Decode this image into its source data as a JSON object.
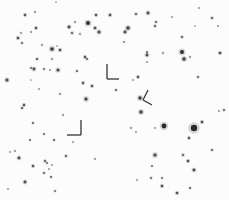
{
  "image": {
    "width": 229,
    "height": 200,
    "background": "#fcfcfc",
    "star_color": "#2a2a2a",
    "marker_color": "#333333"
  },
  "stars": [
    {
      "x": 25,
      "y": 15,
      "r": 1.2
    },
    {
      "x": 35,
      "y": 12,
      "r": 0.8
    },
    {
      "x": 56,
      "y": 2,
      "r": 0.6
    },
    {
      "x": 69,
      "y": 27,
      "r": 1.4
    },
    {
      "x": 72,
      "y": 33,
      "r": 1.1
    },
    {
      "x": 75,
      "y": 22,
      "r": 0.8
    },
    {
      "x": 88,
      "y": 23,
      "r": 2.0
    },
    {
      "x": 95,
      "y": 28,
      "r": 1.3
    },
    {
      "x": 96,
      "y": 15,
      "r": 1.2
    },
    {
      "x": 99,
      "y": 32,
      "r": 1.5
    },
    {
      "x": 80,
      "y": 34,
      "r": 0.8
    },
    {
      "x": 110,
      "y": 15,
      "r": 1.3
    },
    {
      "x": 36,
      "y": 28,
      "r": 1.2
    },
    {
      "x": 31,
      "y": 32,
      "r": 0.8
    },
    {
      "x": 21,
      "y": 33,
      "r": 0.8
    },
    {
      "x": 18,
      "y": 38,
      "r": 1.3
    },
    {
      "x": 22,
      "y": 43,
      "r": 1.0
    },
    {
      "x": 42,
      "y": 45,
      "r": 0.8
    },
    {
      "x": 52,
      "y": 49,
      "r": 1.8
    },
    {
      "x": 60,
      "y": 50,
      "r": 1.3
    },
    {
      "x": 57,
      "y": 46,
      "r": 0.6
    },
    {
      "x": 37,
      "y": 59,
      "r": 1.1
    },
    {
      "x": 52,
      "y": 59,
      "r": 0.8
    },
    {
      "x": 85,
      "y": 57,
      "r": 1.2
    },
    {
      "x": 87,
      "y": 59,
      "r": 1.0
    },
    {
      "x": 31,
      "y": 68,
      "r": 0.9
    },
    {
      "x": 34,
      "y": 69,
      "r": 1.4
    },
    {
      "x": 44,
      "y": 69,
      "r": 0.9
    },
    {
      "x": 50,
      "y": 70,
      "r": 0.7
    },
    {
      "x": 58,
      "y": 70,
      "r": 1.5
    },
    {
      "x": 77,
      "y": 71,
      "r": 1.0
    },
    {
      "x": 7,
      "y": 80,
      "r": 1.5
    },
    {
      "x": 31,
      "y": 80,
      "r": 0.6
    },
    {
      "x": 39,
      "y": 89,
      "r": 0.7
    },
    {
      "x": 60,
      "y": 94,
      "r": 0.8
    },
    {
      "x": 83,
      "y": 83,
      "r": 1.2
    },
    {
      "x": 92,
      "y": 86,
      "r": 1.2
    },
    {
      "x": 86,
      "y": 99,
      "r": 1.6
    },
    {
      "x": 136,
      "y": 14,
      "r": 1.1
    },
    {
      "x": 148,
      "y": 13,
      "r": 1.4
    },
    {
      "x": 156,
      "y": 22,
      "r": 1.0
    },
    {
      "x": 155,
      "y": 26,
      "r": 1.1
    },
    {
      "x": 128,
      "y": 28,
      "r": 1.7
    },
    {
      "x": 125,
      "y": 32,
      "r": 1.4
    },
    {
      "x": 124,
      "y": 42,
      "r": 0.8
    },
    {
      "x": 172,
      "y": 17,
      "r": 0.7
    },
    {
      "x": 199,
      "y": 8,
      "r": 0.7
    },
    {
      "x": 212,
      "y": 18,
      "r": 1.1
    },
    {
      "x": 218,
      "y": 26,
      "r": 0.7
    },
    {
      "x": 195,
      "y": 26,
      "r": 0.6
    },
    {
      "x": 182,
      "y": 37,
      "r": 1.1
    },
    {
      "x": 147,
      "y": 52,
      "r": 0.9
    },
    {
      "x": 147,
      "y": 55,
      "r": 1.4
    },
    {
      "x": 163,
      "y": 53,
      "r": 0.8
    },
    {
      "x": 182,
      "y": 52,
      "r": 2.0
    },
    {
      "x": 184,
      "y": 59,
      "r": 1.7
    },
    {
      "x": 190,
      "y": 57,
      "r": 0.8
    },
    {
      "x": 220,
      "y": 53,
      "r": 1.3
    },
    {
      "x": 147,
      "y": 62,
      "r": 0.7
    },
    {
      "x": 138,
      "y": 77,
      "r": 1.2
    },
    {
      "x": 133,
      "y": 80,
      "r": 0.7
    },
    {
      "x": 198,
      "y": 77,
      "r": 1.0
    },
    {
      "x": 116,
      "y": 90,
      "r": 1.0
    },
    {
      "x": 140,
      "y": 98,
      "r": 1.7
    },
    {
      "x": 141,
      "y": 112,
      "r": 1.7
    },
    {
      "x": 164,
      "y": 126,
      "r": 2.4
    },
    {
      "x": 194,
      "y": 128,
      "r": 3.2
    },
    {
      "x": 202,
      "y": 122,
      "r": 1.3
    },
    {
      "x": 189,
      "y": 138,
      "r": 1.2
    },
    {
      "x": 155,
      "y": 128,
      "r": 0.7
    },
    {
      "x": 131,
      "y": 128,
      "r": 0.8
    },
    {
      "x": 136,
      "y": 132,
      "r": 0.7
    },
    {
      "x": 212,
      "y": 150,
      "r": 1.0
    },
    {
      "x": 183,
      "y": 155,
      "r": 1.1
    },
    {
      "x": 188,
      "y": 161,
      "r": 1.3
    },
    {
      "x": 155,
      "y": 155,
      "r": 1.6
    },
    {
      "x": 194,
      "y": 170,
      "r": 1.4
    },
    {
      "x": 152,
      "y": 166,
      "r": 0.9
    },
    {
      "x": 151,
      "y": 178,
      "r": 1.0
    },
    {
      "x": 162,
      "y": 178,
      "r": 0.9
    },
    {
      "x": 162,
      "y": 186,
      "r": 1.3
    },
    {
      "x": 137,
      "y": 180,
      "r": 0.7
    },
    {
      "x": 177,
      "y": 193,
      "r": 1.3
    },
    {
      "x": 190,
      "y": 188,
      "r": 1.0
    },
    {
      "x": 224,
      "y": 110,
      "r": 1.0
    },
    {
      "x": 219,
      "y": 111,
      "r": 0.7
    },
    {
      "x": 22,
      "y": 108,
      "r": 1.1
    },
    {
      "x": 24,
      "y": 105,
      "r": 1.2
    },
    {
      "x": 63,
      "y": 115,
      "r": 0.8
    },
    {
      "x": 33,
      "y": 123,
      "r": 1.0
    },
    {
      "x": 44,
      "y": 134,
      "r": 0.9
    },
    {
      "x": 54,
      "y": 140,
      "r": 1.0
    },
    {
      "x": 30,
      "y": 140,
      "r": 0.9
    },
    {
      "x": 73,
      "y": 142,
      "r": 0.7
    },
    {
      "x": 19,
      "y": 158,
      "r": 1.4
    },
    {
      "x": 15,
      "y": 151,
      "r": 0.8
    },
    {
      "x": 10,
      "y": 152,
      "r": 0.7
    },
    {
      "x": 45,
      "y": 161,
      "r": 1.1
    },
    {
      "x": 47,
      "y": 163,
      "r": 0.9
    },
    {
      "x": 66,
      "y": 156,
      "r": 1.1
    },
    {
      "x": 95,
      "y": 159,
      "r": 0.8
    },
    {
      "x": 33,
      "y": 166,
      "r": 1.2
    },
    {
      "x": 52,
      "y": 165,
      "r": 0.7
    },
    {
      "x": 49,
      "y": 169,
      "r": 0.7
    },
    {
      "x": 44,
      "y": 173,
      "r": 1.0
    },
    {
      "x": 51,
      "y": 177,
      "r": 1.0
    },
    {
      "x": 25,
      "y": 182,
      "r": 1.4
    },
    {
      "x": 55,
      "y": 191,
      "r": 0.9
    },
    {
      "x": 8,
      "y": 189,
      "r": 0.7
    }
  ],
  "markers": [
    {
      "name": "target-marker-1",
      "lines": [
        [
          107,
          64,
          107,
          79
        ],
        [
          107,
          79,
          119,
          79
        ]
      ]
    },
    {
      "name": "target-marker-2",
      "lines": [
        [
          148,
          90,
          143,
          100
        ],
        [
          143,
          100,
          152,
          105
        ]
      ]
    },
    {
      "name": "target-marker-3",
      "lines": [
        [
          81,
          120,
          81,
          135
        ],
        [
          67,
          135,
          81,
          135
        ]
      ]
    }
  ]
}
